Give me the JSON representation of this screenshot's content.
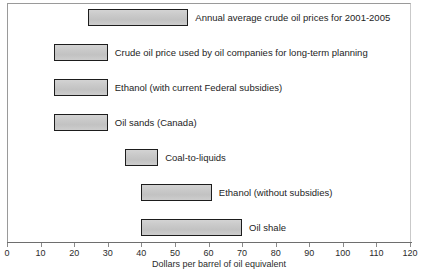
{
  "chart_data": {
    "type": "bar",
    "orientation": "horizontal",
    "subtype": "range-bar",
    "title": "",
    "xlabel": "Dollars per barrel of oil equivalent",
    "ylabel": "",
    "xlim": [
      0,
      120
    ],
    "xticks": [
      0,
      10,
      20,
      30,
      40,
      50,
      60,
      70,
      80,
      90,
      100,
      110,
      120
    ],
    "grid": false,
    "legend": "none",
    "bar_fill_color": "#c9c9c9",
    "bar_border_color": "#1d1d1d",
    "categories": [
      "Annual average crude oil prices for 2001-2005",
      "Crude oil price used by oil companies for long-term planning",
      "Ethanol (with current Federal subsidies)",
      "Oil sands (Canada)",
      "Coal-to-liquids",
      "Ethanol (without subsidies)",
      "Oil shale"
    ],
    "ranges": [
      {
        "label": "Annual average crude oil prices for 2001-2005",
        "start": 24,
        "end": 54
      },
      {
        "label": "Crude oil price used by oil companies for long-term planning",
        "start": 14,
        "end": 30
      },
      {
        "label": "Ethanol (with current Federal subsidies)",
        "start": 14,
        "end": 30
      },
      {
        "label": "Oil sands (Canada)",
        "start": 14,
        "end": 30
      },
      {
        "label": "Coal-to-liquids",
        "start": 35,
        "end": 45
      },
      {
        "label": "Ethanol (without subsidies)",
        "start": 40,
        "end": 61
      },
      {
        "label": "Oil shale",
        "start": 40,
        "end": 70
      }
    ]
  }
}
